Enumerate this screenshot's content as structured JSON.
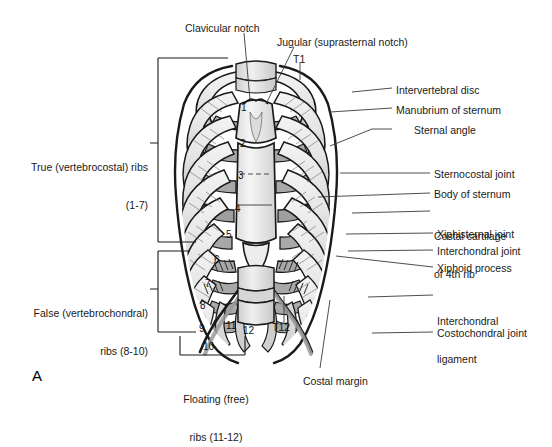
{
  "figure": {
    "panel_letter": "A",
    "background_color": "#ffffff",
    "line_color": "#1a1a1a"
  },
  "palette": {
    "rib_light": "#e9e9e9",
    "rib_mid": "#c9c9c9",
    "cartilage_gray": "#a9a9a9",
    "cartilage_dark": "#8f8f8f",
    "sternum_fill": "#f2f2f2",
    "vertebra_fill": "#ededed",
    "outline": "#1a1a1a",
    "leader": "#3a3a3a"
  },
  "labels_left": [
    {
      "id": "true-ribs",
      "lines": [
        "True (vertebrocostal) ribs",
        "(1-7)"
      ],
      "x": 18,
      "y": 136,
      "bracket": {
        "x": 158,
        "y_top": 58,
        "y_bottom": 242,
        "tick_y": 143
      }
    },
    {
      "id": "false-ribs",
      "lines": [
        "False (vertebrochondral)",
        "ribs (8-10)"
      ],
      "x": 18,
      "y": 282,
      "bracket": {
        "x": 158,
        "y_top": 251,
        "y_bottom": 332,
        "tick_y": 289
      }
    }
  ],
  "labels_bottom": [
    {
      "id": "floating-ribs",
      "lines": [
        "Floating (free)",
        "ribs (11-12)"
      ],
      "x": 168,
      "y": 368,
      "bracket": {
        "y": 355,
        "x_left": 180,
        "x_right": 245
      }
    },
    {
      "id": "costal-margin",
      "lines": [
        "Costal margin"
      ],
      "x": 303,
      "y": 375
    },
    {
      "id": "t12-vertebra",
      "lines": [
        "T12"
      ],
      "x": 272,
      "y": 327
    }
  ],
  "labels_top": [
    {
      "id": "clavicular-notch",
      "lines": [
        "Clavicular notch"
      ],
      "x": 185,
      "y": 22
    },
    {
      "id": "jugular-notch",
      "lines": [
        "Jugular (suprasternal notch)"
      ],
      "x": 277,
      "y": 36
    },
    {
      "id": "t1-vertebra",
      "lines": [
        "T1"
      ],
      "x": 293,
      "y": 53
    }
  ],
  "labels_right": [
    {
      "id": "intervertebral-disc",
      "lines": [
        "Intervertebral disc"
      ],
      "x": 396,
      "y": 84,
      "leader_x0": 352,
      "leader_y0": 92
    },
    {
      "id": "manubrium-of-sternum",
      "lines": [
        "Manubrium of sternum"
      ],
      "x": 396,
      "y": 104,
      "leader_x0": 330,
      "leader_y0": 110
    },
    {
      "id": "sternal-angle",
      "lines": [
        "Sternal angle"
      ],
      "x": 414,
      "y": 125,
      "leader_x0": 330,
      "leader_y0": 146
    },
    {
      "id": "sternocostal-joint",
      "lines": [
        "Sternocostal joint"
      ],
      "x": 434,
      "y": 169,
      "leader_x0": 340,
      "leader_y0": 172
    },
    {
      "id": "body-of-sternum",
      "lines": [
        "Body of sternum"
      ],
      "x": 434,
      "y": 189,
      "leader_x0": 318,
      "leader_y0": 196
    },
    {
      "id": "costal-cartilage-4th",
      "lines": [
        "Costal cartilage",
        "of 4th rib"
      ],
      "x": 434,
      "y": 206,
      "leader_x0": 352,
      "leader_y0": 212
    },
    {
      "id": "xiphisternal-joint",
      "lines": [
        "Xiphisternal joint"
      ],
      "x": 437,
      "y": 229,
      "leader_x0": 346,
      "leader_y0": 233
    },
    {
      "id": "interchondral-joint",
      "lines": [
        "Interchondral joint"
      ],
      "x": 437,
      "y": 246,
      "leader_x0": 348,
      "leader_y0": 250
    },
    {
      "id": "xiphoid-process",
      "lines": [
        "Xiphoid process"
      ],
      "x": 437,
      "y": 263,
      "leader_x0": 336,
      "leader_y0": 252
    },
    {
      "id": "interchondral-ligament",
      "lines": [
        "Interchondral",
        "ligament"
      ],
      "x": 437,
      "y": 291,
      "leader_x0": 368,
      "leader_y0": 296
    },
    {
      "id": "costochondral-joint",
      "lines": [
        "Costochondral joint"
      ],
      "x": 437,
      "y": 328,
      "leader_x0": 372,
      "leader_y0": 332
    }
  ],
  "rib_numbers": [
    {
      "n": "1",
      "x": 241,
      "y": 102
    },
    {
      "n": "2",
      "x": 240,
      "y": 138
    },
    {
      "n": "3",
      "x": 238,
      "y": 170
    },
    {
      "n": "4",
      "x": 235,
      "y": 203
    },
    {
      "n": "5",
      "x": 226,
      "y": 229
    },
    {
      "n": "6",
      "x": 214,
      "y": 254
    },
    {
      "n": "7",
      "x": 205,
      "y": 278
    },
    {
      "n": "8",
      "x": 200,
      "y": 300
    },
    {
      "n": "9",
      "x": 199,
      "y": 323
    },
    {
      "n": "10",
      "x": 203,
      "y": 341
    },
    {
      "n": "11",
      "x": 226,
      "y": 320
    },
    {
      "n": "12",
      "x": 243,
      "y": 325
    }
  ]
}
